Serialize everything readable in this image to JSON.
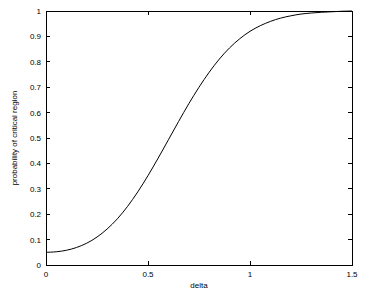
{
  "chart_data": {
    "type": "line",
    "title": "",
    "subtitle": "",
    "xlabel": "delta",
    "ylabel": "probability of critical region",
    "xlim": [
      0,
      1.5
    ],
    "ylim": [
      0,
      1
    ],
    "grid": false,
    "legend": null,
    "xticks": [
      "0",
      "0.5",
      "1",
      "1.5"
    ],
    "xtick_values": [
      0,
      0.5,
      1,
      1.5
    ],
    "yticks": [
      "0",
      "0.1",
      "0.2",
      "0.3",
      "0.4",
      "0.5",
      "0.6",
      "0.7",
      "0.8",
      "0.9",
      "1"
    ],
    "ytick_values": [
      0,
      0.1,
      0.2,
      0.3,
      0.4,
      0.5,
      0.6,
      0.7,
      0.8,
      0.9,
      1
    ],
    "series": [
      {
        "name": "power function",
        "color": "#000000",
        "x": [
          0.0,
          0.05,
          0.1,
          0.15,
          0.2,
          0.25,
          0.3,
          0.35,
          0.4,
          0.45,
          0.5,
          0.55,
          0.6,
          0.65,
          0.7,
          0.75,
          0.8,
          0.85,
          0.9,
          0.95,
          1.0,
          1.05,
          1.1,
          1.15,
          1.2,
          1.25,
          1.3,
          1.35,
          1.4,
          1.45,
          1.5
        ],
        "y": [
          0.05,
          0.052,
          0.058,
          0.069,
          0.086,
          0.11,
          0.142,
          0.182,
          0.231,
          0.288,
          0.352,
          0.421,
          0.493,
          0.565,
          0.635,
          0.7,
          0.759,
          0.811,
          0.855,
          0.891,
          0.92,
          0.942,
          0.959,
          0.972,
          0.981,
          0.988,
          0.992,
          0.995,
          0.997,
          0.999,
          1.0
        ]
      }
    ]
  },
  "figure": {
    "background_color": "#ffffff",
    "axis_color": "#000000"
  }
}
